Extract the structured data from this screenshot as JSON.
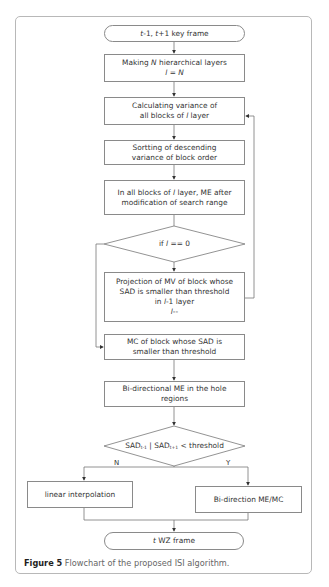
{
  "figure": {
    "caption_label": "Figure 5",
    "caption_text": "Flowchart of the proposed ISI algorithm."
  },
  "flowchart": {
    "start": {
      "var1": "t",
      "text1": "-1, ",
      "var2": "t",
      "text2": "+1 key frame"
    },
    "step_hierarchy": {
      "line1_pre": "Making ",
      "line1_var": "N",
      "line1_post": " hierarchical layers",
      "line2_var1": "l",
      "line2_mid": " = ",
      "line2_var2": "N"
    },
    "step_variance": {
      "line1": "Calculating variance of",
      "line2_pre": "all blocks of ",
      "line2_var": "l",
      "line2_post": " layer"
    },
    "step_sort": {
      "line1": "Sortting of descending",
      "line2": "variance of block order"
    },
    "step_me": {
      "line1_pre": "In all blocks of ",
      "line1_var": "l",
      "line1_post": " layer, ME after",
      "line2": "modification of search range"
    },
    "decision_layer": {
      "pre": "if ",
      "var": "l",
      "post": " == 0"
    },
    "step_projection": {
      "line1": "Projection of MV of block whose",
      "line2": "SAD is smaller than threshold",
      "line3_pre": "in ",
      "line3_var": "l",
      "line3_post": "-1 layer",
      "line4_var": "l",
      "line4_post": "--"
    },
    "step_mc": {
      "line1": "MC of block whose SAD is",
      "line2": "smaller than threshold"
    },
    "step_bidir_hole": {
      "line1": "Bi-directional ME in the hole",
      "line2": "regions"
    },
    "decision_sad": {
      "a": "SAD",
      "a_sub": "t-1",
      "sep": " | ",
      "b": "SAD",
      "b_sub": "t+1",
      "post": " < threshold"
    },
    "branch_no_label": "N",
    "branch_yes_label": "Y",
    "step_linear": "linear interpolation",
    "step_bidir_memc": "Bi-direction ME/MC",
    "end": {
      "var": "t",
      "text": " WZ frame"
    }
  }
}
